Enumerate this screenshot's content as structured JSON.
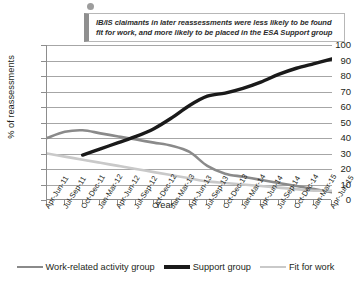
{
  "callout": {
    "text": "IB/IS claimants in later reassessments were less likely to be found fit for work, and more likely to be placed in the ESA Support group",
    "marker": "bullet-dot"
  },
  "colors": {
    "work_related": "#8a8a8a",
    "support": "#1a1a1a",
    "fit_for_work": "#c9c9c9",
    "grid": "#a6a6a6",
    "axis": "#8d8d8d",
    "text": "#231f20"
  },
  "chart_data": {
    "type": "line",
    "title": "",
    "xlabel": "Year",
    "ylabel": "% of reassessments",
    "ylim": [
      0,
      100
    ],
    "ytick_values": [
      0,
      10,
      20,
      30,
      40,
      50,
      60,
      70,
      80,
      90,
      100
    ],
    "grid": true,
    "legend_position": "bottom",
    "categories": [
      "Apr-Jun-11",
      "Jul-Sep-11",
      "Oct-Dec-11",
      "Jan-Mar-12",
      "Apr-Jun-12",
      "Jul-Sep-12",
      "Oct-Dec-12",
      "Jan-Mar-13",
      "Apr-Jun-13",
      "Jul-Sep-13",
      "Oct-Dec-13",
      "Jan-Mar-14",
      "Apr-Jun-14",
      "Jul-Sep-14",
      "Oct-Dec-14",
      "Jan-Mar-15",
      "Apr-Jun-15"
    ],
    "series": [
      {
        "name": "Work-related activity group",
        "color": "#8a8a8a",
        "width": 2.6,
        "values": [
          40,
          44,
          45,
          43,
          41,
          39,
          37,
          35,
          31,
          22,
          17,
          15,
          13,
          11,
          9,
          7,
          5
        ]
      },
      {
        "name": "Support group",
        "color": "#1a1a1a",
        "width": 3.4,
        "values": [
          null,
          null,
          29,
          33,
          37,
          41,
          46,
          53,
          61,
          67,
          69,
          72,
          76,
          81,
          85,
          88,
          91
        ]
      },
      {
        "name": "Fit for work",
        "color": "#c9c9c9",
        "width": 2.6,
        "values": [
          30,
          28,
          26,
          24,
          22,
          20,
          18,
          16,
          14,
          12,
          11,
          10,
          9,
          8,
          7,
          6,
          6
        ]
      }
    ]
  }
}
